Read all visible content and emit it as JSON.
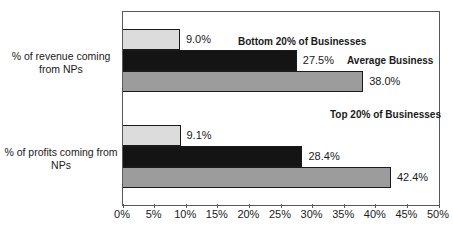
{
  "chart_data": {
    "type": "bar",
    "orientation": "horizontal",
    "title": "",
    "categories": [
      "% of revenue coming from NPs",
      "% of profits coming from NPs"
    ],
    "category_lines": [
      [
        "% of revenue coming",
        "from NPs"
      ],
      [
        "% of profits coming from",
        "NPs"
      ]
    ],
    "series": [
      {
        "name": "Bottom 20% of Businesses",
        "values": [
          9.0,
          9.1
        ],
        "labels": [
          "9.0%",
          "9.1%"
        ],
        "color": "#dcdcdc"
      },
      {
        "name": "Average Business",
        "values": [
          27.5,
          28.4
        ],
        "labels": [
          "27.5%",
          "28.4%"
        ],
        "color": "#141414"
      },
      {
        "name": "Top 20% of Businesses",
        "values": [
          38.0,
          42.4
        ],
        "labels": [
          "38.0%",
          "42.4%"
        ],
        "color": "#9c9c9c"
      }
    ],
    "xlim": [
      0,
      50
    ],
    "x_ticks": [
      "0%",
      "5%",
      "10%",
      "15%",
      "20%",
      "25%",
      "30%",
      "35%",
      "40%",
      "45%",
      "50%"
    ],
    "grid": false,
    "legend_position": "inline-annotations",
    "annotations": [
      {
        "text": "Bottom 20% of Businesses"
      },
      {
        "text": "Average Business"
      },
      {
        "text": "Top 20% of Businesses"
      }
    ],
    "colors": {
      "bar_border": "#1a1a1a",
      "plot_border": "#595959",
      "text": "#1a1a1a",
      "background": "#ffffff"
    }
  }
}
